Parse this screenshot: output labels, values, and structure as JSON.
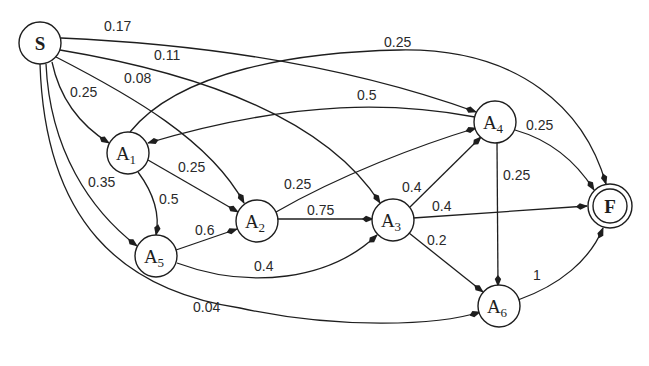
{
  "diagram": {
    "type": "weighted directed graph",
    "nodes": [
      {
        "id": "S",
        "label": "S",
        "sub": "",
        "kind": "start",
        "x": 40,
        "y": 43
      },
      {
        "id": "A1",
        "label": "A",
        "sub": "1",
        "kind": "state",
        "x": 128,
        "y": 153
      },
      {
        "id": "A2",
        "label": "A",
        "sub": "2",
        "kind": "state",
        "x": 257,
        "y": 221
      },
      {
        "id": "A3",
        "label": "A",
        "sub": "3",
        "kind": "state",
        "x": 393,
        "y": 220
      },
      {
        "id": "A4",
        "label": "A",
        "sub": "4",
        "kind": "state",
        "x": 495,
        "y": 122
      },
      {
        "id": "A5",
        "label": "A",
        "sub": "5",
        "kind": "state",
        "x": 156,
        "y": 256
      },
      {
        "id": "A6",
        "label": "A",
        "sub": "6",
        "kind": "state",
        "x": 499,
        "y": 306
      },
      {
        "id": "F",
        "label": "F",
        "sub": "",
        "kind": "final",
        "x": 610,
        "y": 206
      }
    ],
    "edges": [
      {
        "from": "S",
        "to": "A4",
        "weight": "0.17"
      },
      {
        "from": "S",
        "to": "A3",
        "weight": "0.11"
      },
      {
        "from": "S",
        "to": "A2",
        "weight": "0.08"
      },
      {
        "from": "S",
        "to": "A1",
        "weight": "0.25"
      },
      {
        "from": "S",
        "to": "A5",
        "weight": "0.35"
      },
      {
        "from": "S",
        "to": "A6",
        "weight": "0.04"
      },
      {
        "from": "A1",
        "to": "F",
        "weight": "0.25"
      },
      {
        "from": "A4",
        "to": "A1",
        "weight": "0.5"
      },
      {
        "from": "A1",
        "to": "A2",
        "weight": "0.25"
      },
      {
        "from": "A1",
        "to": "A5",
        "weight": "0.5"
      },
      {
        "from": "A5",
        "to": "A2",
        "weight": "0.6"
      },
      {
        "from": "A5",
        "to": "A3",
        "weight": "0.4"
      },
      {
        "from": "A2",
        "to": "A4",
        "weight": "0.25"
      },
      {
        "from": "A2",
        "to": "A3",
        "weight": "0.75"
      },
      {
        "from": "A3",
        "to": "A4",
        "weight": "0.4"
      },
      {
        "from": "A3",
        "to": "F",
        "weight": "0.4"
      },
      {
        "from": "A3",
        "to": "A6",
        "weight": "0.2"
      },
      {
        "from": "A4",
        "to": "F",
        "weight": "0.25"
      },
      {
        "from": "A4",
        "to": "A6",
        "weight": "0.25"
      },
      {
        "from": "A6",
        "to": "F",
        "weight": "1"
      }
    ]
  }
}
